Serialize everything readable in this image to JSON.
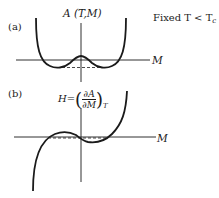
{
  "panel_a": {
    "label": "(a)",
    "y_axis_label": "A (T,M)",
    "x_axis_label": "M",
    "condition": "Fixed T < T",
    "condition_subscript": "c",
    "curve": "double-well free energy A(T,M)"
  },
  "panel_b": {
    "label": "(b)",
    "y_axis_label_prefix": "H=",
    "fraction_numerator": "∂A",
    "fraction_denominator": "∂M",
    "subscript": "T",
    "x_axis_label": "M",
    "curve": "van der Waals-like loop H(M)"
  },
  "colors": {
    "line": "#1a1a1a",
    "background": "#ffffff"
  }
}
